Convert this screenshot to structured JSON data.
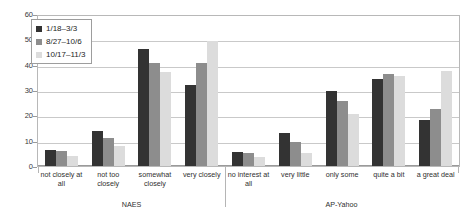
{
  "chart_data": {
    "type": "bar",
    "title": "",
    "subtitle": "",
    "xlabel": "",
    "ylabel": "",
    "ylim": [
      0,
      60
    ],
    "yticks": [
      0,
      10,
      20,
      30,
      40,
      50,
      60
    ],
    "grid": true,
    "legend_position": "top-left",
    "categories": [
      "not closely at all",
      "not too closely",
      "somewhat closely",
      "very closely",
      "no interest at all",
      "very little",
      "only some",
      "quite a bit",
      "a great deal"
    ],
    "groups": [
      {
        "name": "NAES",
        "categories": [
          "not closely at all",
          "not too closely",
          "somewhat closely",
          "very closely"
        ]
      },
      {
        "name": "AP-Yahoo",
        "categories": [
          "no interest at all",
          "very little",
          "only some",
          "quite a bit",
          "a great deal"
        ]
      }
    ],
    "series": [
      {
        "name": "1/18–3/3",
        "color": "#333333",
        "values": [
          6.5,
          14.2,
          47.0,
          32.3,
          5.5,
          13.3,
          30.0,
          35.0,
          18.3
        ]
      },
      {
        "name": "8/27–10/6",
        "color": "#8d8d8d",
        "values": [
          6.2,
          11.3,
          41.3,
          41.4,
          5.3,
          9.8,
          26.2,
          36.8,
          22.8
        ]
      },
      {
        "name": "10/17–11/3",
        "color": "#dcdcdc",
        "values": [
          4.1,
          8.1,
          37.5,
          50.2,
          3.5,
          5.2,
          20.8,
          36.2,
          38.0
        ]
      }
    ]
  },
  "legend": {
    "items": [
      {
        "label": "1/18–3/3",
        "color": "#333333"
      },
      {
        "label": "8/27–10/6",
        "color": "#8d8d8d"
      },
      {
        "label": "10/17–11/3",
        "color": "#dcdcdc"
      }
    ]
  },
  "axis": {
    "y_tick_labels": [
      "0",
      "10",
      "20",
      "30",
      "40",
      "50",
      "60"
    ]
  }
}
